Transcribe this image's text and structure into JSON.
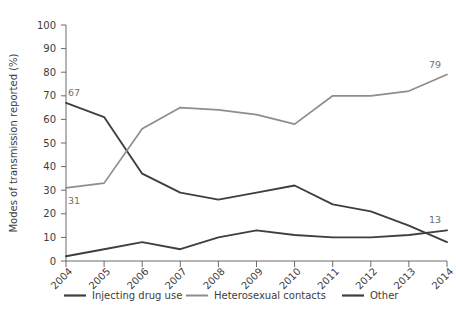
{
  "chart_data": {
    "type": "line",
    "title": "",
    "xlabel": "",
    "ylabel": "Modes of transmission reported (%)",
    "categories": [
      "2004",
      "2005",
      "2006",
      "2007",
      "2008",
      "2009",
      "2010",
      "2011",
      "2012",
      "2013",
      "2014"
    ],
    "ylim": [
      0,
      100
    ],
    "ytick_values": [
      0,
      10,
      20,
      30,
      40,
      50,
      60,
      70,
      80,
      90,
      100
    ],
    "ytick_labels": [
      "0",
      "10",
      "20",
      "30",
      "40",
      "50",
      "60",
      "70",
      "80",
      "90",
      "100"
    ],
    "grid": false,
    "legend_position": "bottom",
    "series": [
      {
        "name": "Injecting drug use",
        "color": "#3f3f3f",
        "values": [
          67,
          61,
          37,
          29,
          26,
          29,
          32,
          24,
          21,
          15,
          8
        ]
      },
      {
        "name": "Heterosexual contacts",
        "color": "#8d8d8d",
        "values": [
          31,
          33,
          56,
          65,
          64,
          62,
          58,
          70,
          70,
          72,
          79
        ]
      },
      {
        "name": "Other",
        "color": "#3f3f3f",
        "values": [
          2,
          5,
          8,
          5,
          10,
          13,
          11,
          10,
          10,
          11,
          13
        ]
      }
    ],
    "annotations": [
      {
        "text": "67",
        "series": "Injecting drug use",
        "category": "2004",
        "value": 67
      },
      {
        "text": "31",
        "series": "Heterosexual contacts",
        "category": "2004",
        "value": 31
      },
      {
        "text": "79",
        "series": "Heterosexual contacts",
        "category": "2014",
        "value": 79
      },
      {
        "text": "13",
        "series": "Other",
        "category": "2014",
        "value": 13
      }
    ]
  },
  "legend": {
    "items": [
      {
        "label": "Injecting drug use"
      },
      {
        "label": "Heterosexual contacts"
      },
      {
        "label": "Other"
      }
    ]
  }
}
